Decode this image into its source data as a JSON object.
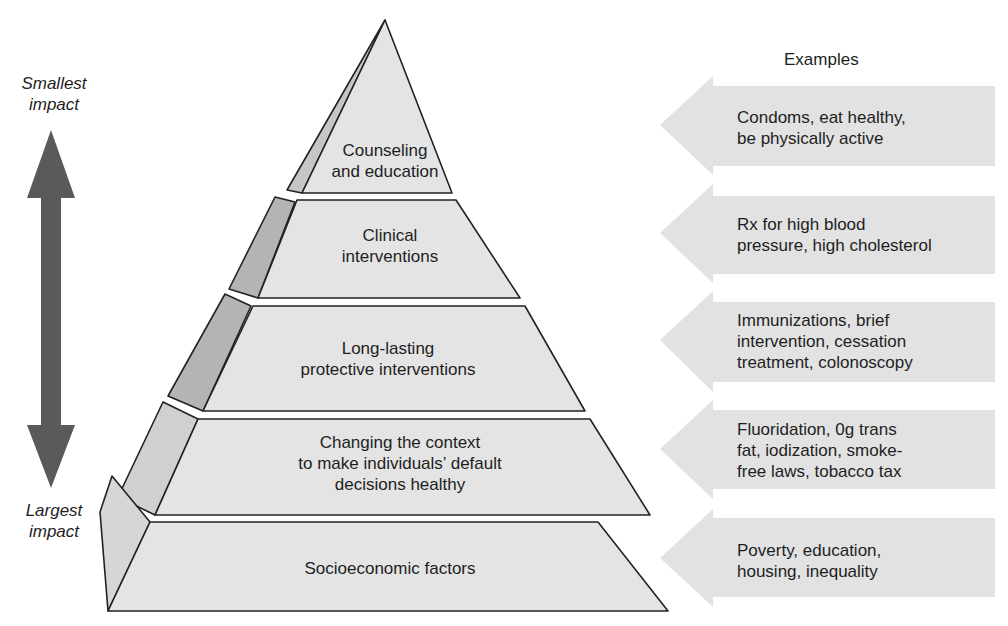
{
  "header": {
    "examples_label": "Examples"
  },
  "impact_axis": {
    "top_label": "Smallest\nimpact",
    "bottom_label": "Largest\nimpact",
    "arrow_color": "#5a5a5a"
  },
  "colors": {
    "tier_front": "#e4e4e4",
    "tier_side": "#b4b4b4",
    "tier_side_light": "#d6d6d6",
    "example_arrow": "#e2e2e2",
    "outline": "#222222"
  },
  "pyramid": {
    "tiers": [
      {
        "label": "Counseling\nand education",
        "example": "Condoms, eat healthy,\nbe physically active"
      },
      {
        "label": "Clinical\ninterventions",
        "example": "Rx for high blood\npressure, high cholesterol"
      },
      {
        "label": "Long-lasting\nprotective interventions",
        "example": "Immunizations, brief\nintervention, cessation\ntreatment, colonoscopy"
      },
      {
        "label": "Changing the context\nto make individuals’ default\ndecisions healthy",
        "example": "Fluoridation, 0g trans\nfat, iodization, smoke-\nfree laws, tobacco tax"
      },
      {
        "label": "Socioeconomic factors",
        "example": "Poverty, education,\nhousing, inequality"
      }
    ]
  }
}
